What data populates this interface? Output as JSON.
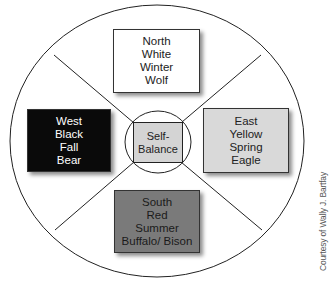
{
  "diagram": {
    "type": "medicine-wheel",
    "center": {
      "label_line1": "Self-",
      "label_line2": "Balance",
      "fill": "#d4d4d4"
    },
    "quadrants": [
      {
        "id": "north",
        "lines": [
          "North",
          "White",
          "Winter",
          "Wolf"
        ],
        "fill": "#ffffff",
        "text_color": "#222222"
      },
      {
        "id": "east",
        "lines": [
          "East",
          "Yellow",
          "Spring",
          "Eagle"
        ],
        "fill": "#d9d9d9",
        "text_color": "#222222"
      },
      {
        "id": "south",
        "lines": [
          "South",
          "Red",
          "Summer",
          "Buffalo/ Bison"
        ],
        "fill": "#7a7a7a",
        "text_color": "#1a1a1a"
      },
      {
        "id": "west",
        "lines": [
          "West",
          "Black",
          "Fall",
          "Bear"
        ],
        "fill": "#0a0a0a",
        "text_color": "#ffffff"
      }
    ]
  },
  "credit": "Courtesy of Wally J. Bartfay"
}
